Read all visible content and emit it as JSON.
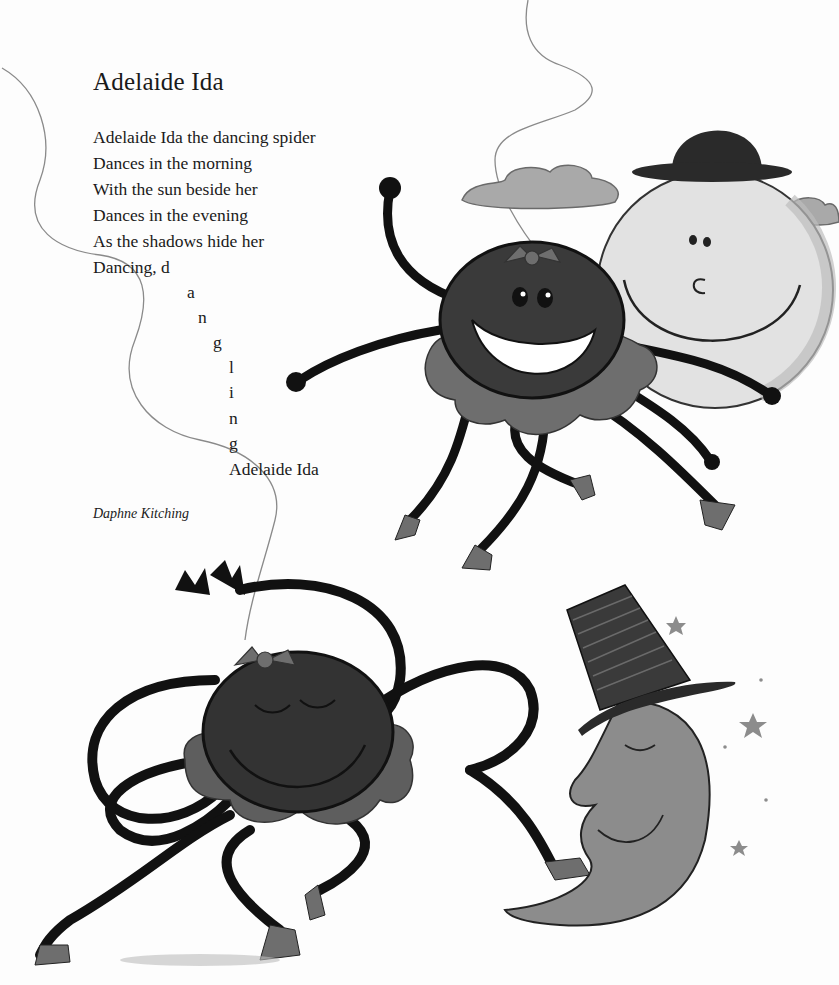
{
  "poem": {
    "title": "Adelaide Ida",
    "lines": [
      "Adelaide Ida the dancing spider",
      "Dances in the morning",
      "With the sun beside her",
      "Dances in the evening",
      "As the shadows hide her",
      "Dancing, d"
    ],
    "cascade_letters": [
      "a",
      "n",
      "g",
      "l",
      "i",
      "n",
      "g"
    ],
    "final_line": "Adelaide Ida",
    "author": "Daphne Kitching"
  },
  "illustrations": {
    "top": {
      "characters": [
        "spider-smiling-in-tutu",
        "sun-with-bowler-hat",
        "clouds"
      ]
    },
    "bottom": {
      "characters": [
        "spider-eyes-closed-in-tutu",
        "crescent-moon-with-top-hat",
        "stars"
      ]
    }
  },
  "colors": {
    "background": "#fdfdfd",
    "text": "#1a1a1a",
    "spider_body": "#3a3a3a",
    "spider_legs": "#111111",
    "tutu": "#6e6e6e",
    "sun": "#e2e2e2",
    "cloud": "#a9a9a9",
    "moon": "#8c8c8c",
    "hat": "#2a2a2a",
    "thread": "#8a8a8a"
  }
}
